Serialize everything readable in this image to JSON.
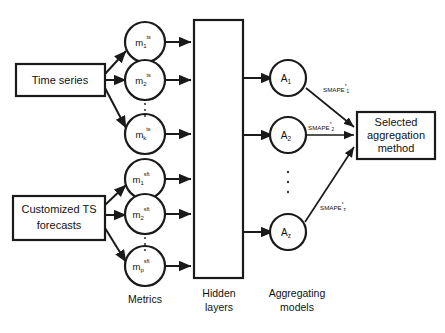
{
  "diagram": {
    "background_color": "#ffffff",
    "stroke_color": "#1a1a1a",
    "inputs": [
      {
        "id": "time-series",
        "label": "Time series"
      },
      {
        "id": "customized-ts-forecasts",
        "label_line1": "Customized TS",
        "label_line2": "forecasts"
      }
    ],
    "metrics": {
      "caption": "Metrics",
      "group_ts": [
        {
          "base": "m",
          "sub": "1",
          "sup": "ts"
        },
        {
          "base": "m",
          "sub": "2",
          "sup": "ts"
        },
        {
          "base": "m",
          "sub": "k",
          "sup": "ts"
        }
      ],
      "group_sft": [
        {
          "base": "m",
          "sub": "1",
          "sup": "sft"
        },
        {
          "base": "m",
          "sub": "2",
          "sup": "sft"
        },
        {
          "base": "m",
          "sub": "p",
          "sup": "sft"
        }
      ],
      "ellipsis": "⋮"
    },
    "hidden_layers": {
      "caption_line1": "Hidden",
      "caption_line2": "layers"
    },
    "aggregating_models": {
      "caption_line1": "Aggregating",
      "caption_line2": "models",
      "nodes": [
        {
          "base": "A",
          "sub": "1"
        },
        {
          "base": "A",
          "sub": "2"
        },
        {
          "base": "A",
          "sub": "z"
        }
      ],
      "ellipsis": "⋮"
    },
    "edge_labels": [
      {
        "base": "SMAPE",
        "sup": "*",
        "sub": "1"
      },
      {
        "base": "SMAPE",
        "sup": "*",
        "sub": "2"
      },
      {
        "base": "SMAPE",
        "sup": "*",
        "sub": "z"
      }
    ],
    "output": {
      "label_line1": "Selected",
      "label_line2": "aggregation",
      "label_line3": "method"
    }
  }
}
